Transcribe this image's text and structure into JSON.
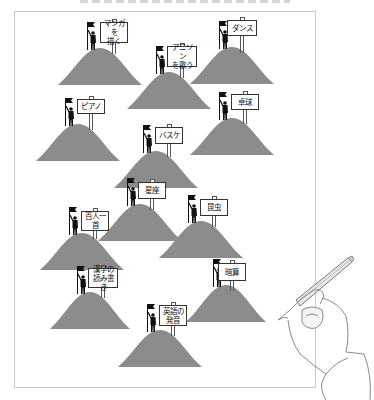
{
  "illustration": {
    "hill_color": "#8c8c8c",
    "frame_color": "#c8c8c8",
    "hills": [
      {
        "label": "マンガを\n描く",
        "hill": {
          "x": 58,
          "y": 48,
          "w": 84,
          "h": 37
        },
        "sign": {
          "x": 100,
          "y": 22,
          "w": 28,
          "h": 21
        }
      },
      {
        "label": "アニソン\nを歌う",
        "hill": {
          "x": 127,
          "y": 72,
          "w": 84,
          "h": 37
        },
        "sign": {
          "x": 167,
          "y": 46,
          "w": 30,
          "h": 21
        }
      },
      {
        "label": "ダンス",
        "hill": {
          "x": 190,
          "y": 47,
          "w": 84,
          "h": 37
        },
        "sign": {
          "x": 227,
          "y": 20,
          "w": 30,
          "h": 16
        }
      },
      {
        "label": "ピアノ",
        "hill": {
          "x": 36,
          "y": 124,
          "w": 84,
          "h": 37
        },
        "sign": {
          "x": 77,
          "y": 99,
          "w": 28,
          "h": 15
        }
      },
      {
        "label": "卓球",
        "hill": {
          "x": 190,
          "y": 118,
          "w": 84,
          "h": 37
        },
        "sign": {
          "x": 231,
          "y": 94,
          "w": 28,
          "h": 16
        }
      },
      {
        "label": "バスケ",
        "hill": {
          "x": 114,
          "y": 151,
          "w": 84,
          "h": 37
        },
        "sign": {
          "x": 155,
          "y": 127,
          "w": 28,
          "h": 17
        }
      },
      {
        "label": "星座",
        "hill": {
          "x": 98,
          "y": 204,
          "w": 84,
          "h": 37
        },
        "sign": {
          "x": 138,
          "y": 182,
          "w": 28,
          "h": 17
        }
      },
      {
        "label": "昆虫",
        "hill": {
          "x": 159,
          "y": 221,
          "w": 84,
          "h": 37
        },
        "sign": {
          "x": 200,
          "y": 199,
          "w": 28,
          "h": 17
        }
      },
      {
        "label": "百人一首",
        "hill": {
          "x": 40,
          "y": 233,
          "w": 84,
          "h": 37
        },
        "sign": {
          "x": 81,
          "y": 211,
          "w": 28,
          "h": 20
        }
      },
      {
        "label": "漢字の\n読み書き",
        "hill": {
          "x": 50,
          "y": 292,
          "w": 80,
          "h": 37
        },
        "sign": {
          "x": 88,
          "y": 268,
          "w": 30,
          "h": 20
        }
      },
      {
        "label": "暗算",
        "hill": {
          "x": 186,
          "y": 285,
          "w": 80,
          "h": 37
        },
        "sign": {
          "x": 218,
          "y": 263,
          "w": 28,
          "h": 18
        }
      },
      {
        "label": "英語の\n発音",
        "hill": {
          "x": 118,
          "y": 330,
          "w": 84,
          "h": 37
        },
        "sign": {
          "x": 159,
          "y": 305,
          "w": 28,
          "h": 21
        }
      }
    ]
  }
}
